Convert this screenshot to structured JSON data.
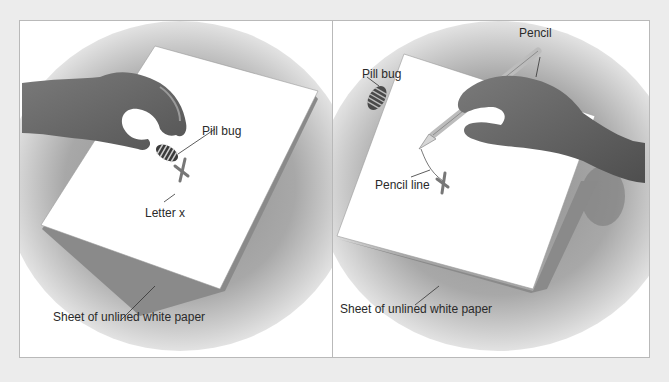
{
  "figure": {
    "panels": [
      {
        "id": "left",
        "labels": {
          "pill_bug": "Pill bug",
          "letter_x": "Letter x",
          "paper": "Sheet of unlined white paper"
        }
      },
      {
        "id": "right",
        "labels": {
          "pencil": "Pencil",
          "pill_bug": "Pill bug",
          "pencil_line": "Pencil line",
          "paper": "Sheet of unlined white paper"
        }
      }
    ]
  },
  "colors": {
    "page_background": "#ececec",
    "frame_border": "#b9b9b9",
    "table_shadow": "#9a9a9a",
    "paper": "#ffffff",
    "hand": "#6e6e6e",
    "x_mark": "#777777",
    "label_text": "#2a2a2a"
  }
}
